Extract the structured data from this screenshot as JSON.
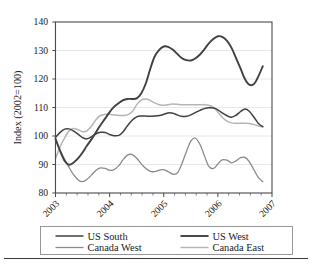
{
  "figure": {
    "kind": "line-chart-figure",
    "background": "#ffffff",
    "plot_border_color": "#4a4a4a",
    "gridline_color": "#e2e2e2"
  },
  "axes": {
    "y_axis_title": "Index (2002=100)",
    "y_ticks": [
      "140",
      "130",
      "120",
      "110",
      "100",
      "90",
      "80"
    ],
    "y_min": 80,
    "y_max": 140,
    "x_ticks": [
      "2003",
      "2004",
      "2005",
      "2006",
      "2007"
    ],
    "x_min": 2003,
    "x_max": 2007
  },
  "legend": {
    "entries": [
      {
        "label": "US South",
        "color": "#3f3f3f",
        "width": 1.5
      },
      {
        "label": "US West",
        "color": "#404040",
        "width": 1.9
      },
      {
        "label": "Canada West",
        "color": "#8a8a8a",
        "width": 1.3
      },
      {
        "label": "Canada East",
        "color": "#b5b5b5",
        "width": 1.5
      }
    ]
  },
  "chart_data": {
    "type": "line",
    "title": "",
    "xlabel": "",
    "ylabel": "Index (2002=100)",
    "xlim": [
      2003,
      2007
    ],
    "ylim": [
      80,
      140
    ],
    "y_ticks": [
      80,
      90,
      100,
      110,
      120,
      130,
      140
    ],
    "x_tick_labels": [
      "2003",
      "2004",
      "2005",
      "2006",
      "2007"
    ],
    "grid": "horizontal",
    "legend_position": "bottom",
    "minor_x_ticks_per_interval": 4,
    "x": [
      2003.0,
      2003.08,
      2003.17,
      2003.25,
      2003.33,
      2003.42,
      2003.5,
      2003.58,
      2003.67,
      2003.75,
      2003.83,
      2003.92,
      2004.0,
      2004.08,
      2004.17,
      2004.25,
      2004.33,
      2004.42,
      2004.5,
      2004.58,
      2004.67,
      2004.75,
      2004.83,
      2004.92,
      2005.0,
      2005.08,
      2005.17,
      2005.25,
      2005.33,
      2005.42,
      2005.5,
      2005.58,
      2005.67,
      2005.75,
      2005.83,
      2005.92,
      2006.0,
      2006.08,
      2006.17,
      2006.25,
      2006.33,
      2006.42,
      2006.5,
      2006.58,
      2006.67,
      2006.75,
      2006.83
    ],
    "series": [
      {
        "name": "US South",
        "color": "#3f3f3f",
        "values": [
          99.5,
          101.2,
          102.4,
          102.5,
          101.8,
          100.6,
          99.4,
          99.0,
          99.8,
          100.8,
          101.3,
          101.2,
          100.5,
          100.1,
          100.2,
          101.5,
          103.6,
          105.6,
          106.7,
          107.0,
          107.0,
          106.9,
          107.0,
          107.2,
          107.6,
          108.1,
          108.0,
          107.4,
          106.9,
          106.9,
          107.4,
          108.2,
          109.0,
          109.6,
          109.9,
          109.8,
          109.2,
          108.1,
          107.1,
          106.6,
          107.2,
          108.6,
          109.5,
          108.7,
          106.5,
          104.4,
          103.3
        ]
      },
      {
        "name": "US West",
        "color": "#404040",
        "values": [
          99.0,
          95.0,
          91.2,
          89.9,
          90.6,
          92.2,
          94.2,
          96.6,
          99.0,
          101.4,
          103.8,
          106.2,
          108.4,
          110.2,
          111.6,
          112.6,
          113.0,
          113.0,
          113.2,
          114.8,
          118.5,
          123.5,
          127.8,
          130.3,
          131.4,
          131.3,
          130.3,
          128.8,
          127.4,
          126.6,
          126.5,
          127.2,
          128.6,
          130.4,
          132.4,
          134.1,
          135.0,
          134.8,
          133.4,
          131.0,
          127.6,
          123.6,
          120.0,
          118.0,
          118.3,
          121.0,
          124.5
        ]
      },
      {
        "name": "Canada West",
        "color": "#8a8a8a",
        "values": [
          99.0,
          95.2,
          91.8,
          89.0,
          86.5,
          84.6,
          84.0,
          84.8,
          86.4,
          88.0,
          88.8,
          88.6,
          88.0,
          88.2,
          89.6,
          91.7,
          93.3,
          93.5,
          92.2,
          90.3,
          88.6,
          87.6,
          87.5,
          88.0,
          88.2,
          87.5,
          86.6,
          87.0,
          90.0,
          94.6,
          98.2,
          99.3,
          97.0,
          93.2,
          89.4,
          88.6,
          90.2,
          91.6,
          91.5,
          90.6,
          91.2,
          92.4,
          92.5,
          91.0,
          88.0,
          85.4,
          84.0
        ]
      },
      {
        "name": "Canada East",
        "color": "#b5b5b5",
        "values": [
          92.0,
          96.0,
          99.4,
          101.8,
          102.6,
          102.2,
          101.5,
          101.8,
          103.6,
          105.8,
          107.2,
          107.6,
          107.6,
          107.4,
          107.2,
          107.2,
          107.4,
          108.6,
          111.0,
          112.6,
          113.0,
          112.5,
          111.6,
          111.0,
          110.8,
          111.0,
          111.2,
          111.1,
          111.0,
          111.0,
          111.0,
          111.0,
          111.0,
          111.0,
          110.8,
          110.0,
          108.4,
          106.6,
          105.2,
          104.6,
          104.5,
          104.5,
          104.5,
          104.4,
          104.0,
          103.5,
          103.2
        ]
      }
    ]
  }
}
